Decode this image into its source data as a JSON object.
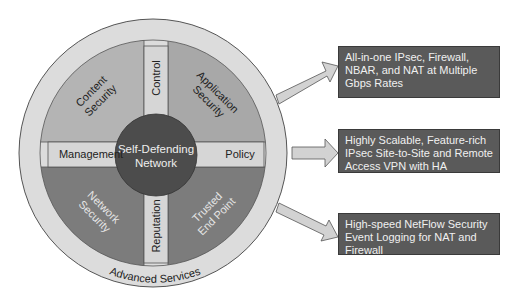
{
  "diagram": {
    "center": {
      "line1": "Self-Defending",
      "line2": "Network"
    },
    "quadrants": {
      "top_left": {
        "line1": "Content",
        "line2": "Security"
      },
      "top_right": {
        "line1": "Application",
        "line2": "Security"
      },
      "bottom_left": {
        "line1": "Network",
        "line2": "Security"
      },
      "bottom_right": {
        "line1": "Trusted",
        "line2": "End Point"
      }
    },
    "bars": {
      "top": "Control",
      "left": "Management",
      "right": "Policy",
      "bottom": "Reputation"
    },
    "outer_ring": "Advanced Services"
  },
  "features": [
    {
      "text": "All-in-one IPsec, Firewall, NBAR, and NAT at Multiple Gbps Rates"
    },
    {
      "text": "Highly Scalable, Feature-rich IPsec Site-to-Site and Remote Access VPN with HA"
    },
    {
      "text": "High-speed NetFlow Security Event Logging for NAT and Firewall"
    }
  ],
  "colors": {
    "outer_ring": "#d9d9d9",
    "top_quadrants": "#b0b0b0",
    "bottom_quadrants": "#7a7a7a",
    "bars": "#d4d4d4",
    "center": "#4a4a4a",
    "boxes": "#5a5a5a",
    "arrows": "#d0d0d0"
  }
}
